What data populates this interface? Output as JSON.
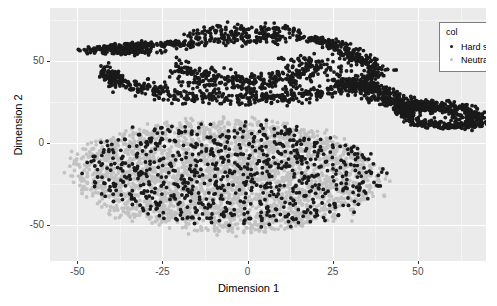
{
  "chart_data": {
    "type": "scatter",
    "title": "",
    "xlabel": "Dimension 1",
    "ylabel": "Dimension 2",
    "xlim": [
      -58,
      70
    ],
    "ylim": [
      -72,
      82
    ],
    "xticks": [
      "-50",
      "-25",
      "0",
      "25",
      "50"
    ],
    "xtick_values": [
      -50,
      -25,
      0,
      25,
      50
    ],
    "yticks": [
      "50",
      "0",
      "-50"
    ],
    "ytick_values": [
      50,
      0,
      -50
    ],
    "grid": true,
    "legend": {
      "title": "col",
      "position": "top-right",
      "entries": [
        {
          "label": "Hard sweep",
          "color": "#1a1a1a"
        },
        {
          "label": "Neutral region",
          "color": "#c2c2c2"
        }
      ]
    },
    "panel_background": "#ebebeb",
    "gridline_color": "#ffffff",
    "series": [
      {
        "name": "Hard sweep",
        "color": "#1a1a1a",
        "point_size": 2.0,
        "n_points": 2100,
        "clusters": [
          {
            "shape": "arc",
            "cx": -2,
            "cy": 62,
            "rx": 40,
            "ry": 9,
            "thickness": 7,
            "n": 620,
            "note": "upper dense crescent band"
          },
          {
            "shape": "band",
            "cx": -34,
            "cy": 55,
            "rx": 11,
            "ry": 4,
            "thickness": 5,
            "n": 150,
            "note": "left tail of upper arc"
          },
          {
            "shape": "filament",
            "x0": 26,
            "y0": 40,
            "x1": 62,
            "y1": 14,
            "thickness": 7,
            "n": 330,
            "note": "diagonal ribbon to lower right"
          },
          {
            "shape": "loop",
            "cx": 56,
            "cy": 18,
            "rx": 11,
            "ry": 6,
            "thickness": 5,
            "n": 210,
            "note": "closed loop at right end"
          },
          {
            "shape": "blob-mixed",
            "cx": -6,
            "cy": -20,
            "rx": 44,
            "ry": 33,
            "n": 790,
            "note": "dark points scattered through main blob"
          }
        ]
      },
      {
        "name": "Neutral region",
        "color": "#c2c2c2",
        "point_size": 2.0,
        "n_points": 2600,
        "clusters": [
          {
            "shape": "blob",
            "cx": -6,
            "cy": -20,
            "rx": 45,
            "ry": 34,
            "n": 2600,
            "note": "large ellipsoidal cloud lower-left of center"
          }
        ]
      }
    ]
  }
}
